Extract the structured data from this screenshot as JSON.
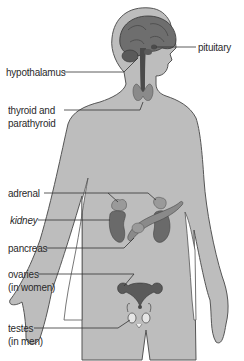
{
  "diagram": {
    "colors": {
      "body_fill": "#bdbdbd",
      "body_outline": "#555555",
      "organ_fill": "#6e6e6e",
      "organ_dark": "#4a4a4a",
      "gland_light": "#9a9a9a",
      "leader_line": "#333333",
      "background": "#ffffff"
    },
    "labels": {
      "pituitary": "pituitary",
      "hypothalamus": "hypothalamus",
      "thyroid_line1": "thyroid and",
      "thyroid_line2": "parathyroid",
      "adrenal": "adrenal",
      "kidney": "kidney",
      "pancreas": "pancreas",
      "ovaries_line1": "ovaries",
      "ovaries_line2": "(in women)",
      "testes_line1": "testes",
      "testes_line2": "(in men)"
    }
  }
}
